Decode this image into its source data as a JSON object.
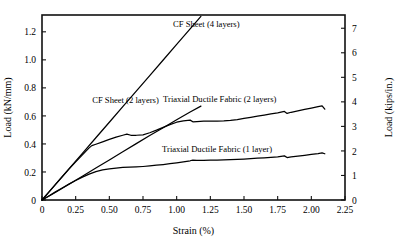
{
  "chart_data": {
    "type": "line",
    "title": "",
    "xlabel": "Strain (%)",
    "ylabel": "Load (kN/mm)",
    "ylabel_right": "Load (kips/in.)",
    "xlim": [
      0,
      2.25
    ],
    "ylim": [
      0,
      1.32
    ],
    "ylim_right": [
      0,
      7.54
    ],
    "grid": false,
    "legend_position": "inline-annotations",
    "xticks": [
      "0",
      "0.25",
      "0.50",
      "0.75",
      "1.00",
      "1.25",
      "1.50",
      "1.75",
      "2.00",
      "2.25"
    ],
    "xtick_values": [
      0,
      0.25,
      0.5,
      0.75,
      1.0,
      1.25,
      1.5,
      1.75,
      2.0,
      2.25
    ],
    "yticks": [
      "0",
      "0.2",
      "0.4",
      "0.6",
      "0.8",
      "1.0",
      "1.2"
    ],
    "ytick_values": [
      0,
      0.2,
      0.4,
      0.6,
      0.8,
      1.0,
      1.2
    ],
    "yticks_right": [
      "0",
      "1",
      "2",
      "3",
      "4",
      "5",
      "6",
      "7"
    ],
    "ytick_values_right": [
      0,
      1,
      2,
      3,
      4,
      5,
      6,
      7
    ],
    "line_color": "#000000",
    "series": [
      {
        "name": "CF Sheet (4 layers)",
        "label_x": 1.22,
        "label_y": 1.235,
        "x": [
          0,
          0.05,
          0.12,
          0.2,
          0.3,
          0.4,
          0.5,
          0.6,
          0.7,
          0.8,
          0.9,
          1.0,
          1.1,
          1.18
        ],
        "values": [
          0,
          0.055,
          0.133,
          0.222,
          0.333,
          0.444,
          0.555,
          0.666,
          0.777,
          0.888,
          0.999,
          1.11,
          1.221,
          1.31
        ]
      },
      {
        "name": "CF Sheet (2 layers)",
        "label_x": 0.62,
        "label_y": 0.695,
        "x": [
          0,
          0.05,
          0.12,
          0.2,
          0.3,
          0.4,
          0.5,
          0.6,
          0.7,
          0.8,
          0.9,
          1.0,
          1.1,
          1.18
        ],
        "values": [
          0,
          0.027,
          0.066,
          0.112,
          0.17,
          0.228,
          0.286,
          0.344,
          0.402,
          0.46,
          0.516,
          0.572,
          0.628,
          0.67
        ]
      },
      {
        "name": "Triaxial Ductile Fabric (2 layers)",
        "label_x": 1.32,
        "label_y": 0.7,
        "x": [
          0,
          0.05,
          0.1,
          0.15,
          0.2,
          0.25,
          0.3,
          0.35,
          0.37,
          0.4,
          0.45,
          0.5,
          0.55,
          0.6,
          0.63,
          0.66,
          0.7,
          0.75,
          0.8,
          0.85,
          0.9,
          0.95,
          1.0,
          1.05,
          1.1,
          1.12,
          1.15,
          1.2,
          1.25,
          1.3,
          1.35,
          1.4,
          1.45,
          1.5,
          1.55,
          1.6,
          1.65,
          1.7,
          1.75,
          1.8,
          1.82,
          1.85,
          1.9,
          1.95,
          2.0,
          2.05,
          2.08,
          2.1
        ],
        "values": [
          0,
          0.056,
          0.112,
          0.166,
          0.22,
          0.272,
          0.322,
          0.372,
          0.388,
          0.398,
          0.415,
          0.432,
          0.448,
          0.462,
          0.47,
          0.462,
          0.462,
          0.465,
          0.48,
          0.498,
          0.518,
          0.538,
          0.555,
          0.565,
          0.57,
          0.558,
          0.56,
          0.562,
          0.562,
          0.562,
          0.564,
          0.568,
          0.574,
          0.582,
          0.59,
          0.598,
          0.606,
          0.614,
          0.622,
          0.632,
          0.618,
          0.626,
          0.636,
          0.646,
          0.656,
          0.666,
          0.672,
          0.648
        ]
      },
      {
        "name": "Triaxial Ductile Fabric (1 layer)",
        "label_x": 1.3,
        "label_y": 0.345,
        "x": [
          0,
          0.05,
          0.1,
          0.15,
          0.2,
          0.25,
          0.3,
          0.35,
          0.4,
          0.45,
          0.5,
          0.55,
          0.6,
          0.65,
          0.7,
          0.75,
          0.8,
          0.85,
          0.9,
          0.95,
          1.0,
          1.05,
          1.1,
          1.12,
          1.15,
          1.2,
          1.25,
          1.3,
          1.35,
          1.4,
          1.45,
          1.5,
          1.55,
          1.6,
          1.65,
          1.7,
          1.75,
          1.8,
          1.82,
          1.85,
          1.9,
          1.95,
          2.0,
          2.05,
          2.08,
          2.1
        ],
        "values": [
          0,
          0.029,
          0.058,
          0.086,
          0.113,
          0.139,
          0.163,
          0.185,
          0.203,
          0.215,
          0.222,
          0.228,
          0.232,
          0.234,
          0.236,
          0.239,
          0.243,
          0.248,
          0.253,
          0.259,
          0.265,
          0.272,
          0.28,
          0.285,
          0.282,
          0.283,
          0.284,
          0.285,
          0.286,
          0.288,
          0.29,
          0.292,
          0.295,
          0.298,
          0.301,
          0.304,
          0.308,
          0.315,
          0.303,
          0.307,
          0.313,
          0.319,
          0.325,
          0.331,
          0.336,
          0.33
        ]
      }
    ]
  }
}
